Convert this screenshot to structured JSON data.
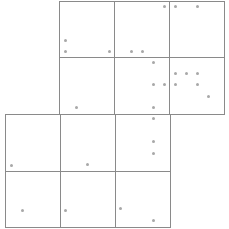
{
  "canvas": {
    "width": 229,
    "height": 229,
    "background": "#ffffff"
  },
  "colors": {
    "line": "#8a8a8a",
    "dot": "#a8a8a8"
  },
  "cells": [
    {
      "x": 59,
      "y": 1,
      "w": 55,
      "h": 56
    },
    {
      "x": 114,
      "y": 1,
      "w": 55,
      "h": 56
    },
    {
      "x": 169,
      "y": 1,
      "w": 55,
      "h": 56
    },
    {
      "x": 59,
      "y": 57,
      "w": 55,
      "h": 57
    },
    {
      "x": 114,
      "y": 57,
      "w": 55,
      "h": 57
    },
    {
      "x": 169,
      "y": 57,
      "w": 55,
      "h": 57
    },
    {
      "x": 5,
      "y": 114,
      "w": 55,
      "h": 57
    },
    {
      "x": 60,
      "y": 114,
      "w": 55,
      "h": 57
    },
    {
      "x": 115,
      "y": 114,
      "w": 55,
      "h": 57
    },
    {
      "x": 5,
      "y": 171,
      "w": 55,
      "h": 56
    },
    {
      "x": 60,
      "y": 171,
      "w": 55,
      "h": 56
    },
    {
      "x": 115,
      "y": 171,
      "w": 55,
      "h": 56
    }
  ],
  "dots": [
    {
      "x": 164,
      "y": 6
    },
    {
      "x": 175,
      "y": 6
    },
    {
      "x": 197,
      "y": 6
    },
    {
      "x": 65,
      "y": 40
    },
    {
      "x": 65,
      "y": 51
    },
    {
      "x": 109,
      "y": 51
    },
    {
      "x": 131,
      "y": 51
    },
    {
      "x": 142,
      "y": 51
    },
    {
      "x": 153,
      "y": 62
    },
    {
      "x": 175,
      "y": 73
    },
    {
      "x": 186,
      "y": 73
    },
    {
      "x": 197,
      "y": 73
    },
    {
      "x": 153,
      "y": 84
    },
    {
      "x": 164,
      "y": 84
    },
    {
      "x": 175,
      "y": 84
    },
    {
      "x": 197,
      "y": 84
    },
    {
      "x": 208,
      "y": 96
    },
    {
      "x": 76,
      "y": 107
    },
    {
      "x": 153,
      "y": 107
    },
    {
      "x": 153,
      "y": 118
    },
    {
      "x": 153,
      "y": 141
    },
    {
      "x": 153,
      "y": 153
    },
    {
      "x": 11,
      "y": 165
    },
    {
      "x": 87,
      "y": 164
    },
    {
      "x": 22,
      "y": 210
    },
    {
      "x": 65,
      "y": 210
    },
    {
      "x": 120,
      "y": 208
    },
    {
      "x": 153,
      "y": 220
    }
  ]
}
